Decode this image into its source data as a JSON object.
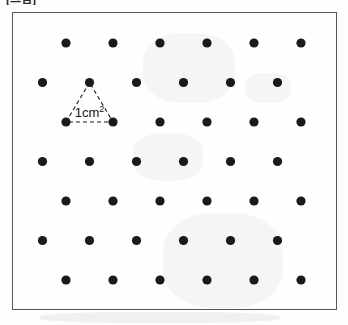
{
  "caption": {
    "fragment_text": "[그림]"
  },
  "figure": {
    "frame": {
      "x": 12,
      "y": 12,
      "width": 325,
      "height": 298,
      "border_color": "#55565a",
      "border_width": 1,
      "fill_color": "#fefefe"
    },
    "dot": {
      "color": "#1a1a1a",
      "radius": 4.6,
      "shape": "circle"
    },
    "lattice": {
      "type": "triangular",
      "columns_per_row": 6,
      "rows": 7,
      "column_spacing": 47,
      "row_spacing": 39.5,
      "row_offset": 23.5,
      "first_row_x": 53,
      "first_row_y": 30,
      "offset_rows": [
        0,
        2,
        4,
        6
      ],
      "points": [
        {
          "row": 0,
          "col": 0,
          "x": 53,
          "y": 30
        },
        {
          "row": 0,
          "col": 1,
          "x": 100,
          "y": 30
        },
        {
          "row": 0,
          "col": 2,
          "x": 147,
          "y": 30
        },
        {
          "row": 0,
          "col": 3,
          "x": 194,
          "y": 30
        },
        {
          "row": 0,
          "col": 4,
          "x": 241,
          "y": 30
        },
        {
          "row": 0,
          "col": 5,
          "x": 288,
          "y": 30
        },
        {
          "row": 1,
          "col": 0,
          "x": 29.5,
          "y": 69.5
        },
        {
          "row": 1,
          "col": 1,
          "x": 76.5,
          "y": 69.5
        },
        {
          "row": 1,
          "col": 2,
          "x": 123.5,
          "y": 69.5
        },
        {
          "row": 1,
          "col": 3,
          "x": 170.5,
          "y": 69.5
        },
        {
          "row": 1,
          "col": 4,
          "x": 217.5,
          "y": 69.5
        },
        {
          "row": 1,
          "col": 5,
          "x": 264.5,
          "y": 69.5
        },
        {
          "row": 2,
          "col": 0,
          "x": 53,
          "y": 109
        },
        {
          "row": 2,
          "col": 1,
          "x": 100,
          "y": 109
        },
        {
          "row": 2,
          "col": 2,
          "x": 147,
          "y": 109
        },
        {
          "row": 2,
          "col": 3,
          "x": 194,
          "y": 109
        },
        {
          "row": 2,
          "col": 4,
          "x": 241,
          "y": 109
        },
        {
          "row": 2,
          "col": 5,
          "x": 288,
          "y": 109
        },
        {
          "row": 3,
          "col": 0,
          "x": 29.5,
          "y": 148.5
        },
        {
          "row": 3,
          "col": 1,
          "x": 76.5,
          "y": 148.5
        },
        {
          "row": 3,
          "col": 2,
          "x": 123.5,
          "y": 148.5
        },
        {
          "row": 3,
          "col": 3,
          "x": 170.5,
          "y": 148.5
        },
        {
          "row": 3,
          "col": 4,
          "x": 217.5,
          "y": 148.5
        },
        {
          "row": 3,
          "col": 5,
          "x": 264.5,
          "y": 148.5
        },
        {
          "row": 4,
          "col": 0,
          "x": 53,
          "y": 188
        },
        {
          "row": 4,
          "col": 1,
          "x": 100,
          "y": 188
        },
        {
          "row": 4,
          "col": 2,
          "x": 147,
          "y": 188
        },
        {
          "row": 4,
          "col": 3,
          "x": 194,
          "y": 188
        },
        {
          "row": 4,
          "col": 4,
          "x": 241,
          "y": 188
        },
        {
          "row": 4,
          "col": 5,
          "x": 288,
          "y": 188
        },
        {
          "row": 5,
          "col": 0,
          "x": 29.5,
          "y": 227.5
        },
        {
          "row": 5,
          "col": 1,
          "x": 76.5,
          "y": 227.5
        },
        {
          "row": 5,
          "col": 2,
          "x": 123.5,
          "y": 227.5
        },
        {
          "row": 5,
          "col": 3,
          "x": 170.5,
          "y": 227.5
        },
        {
          "row": 5,
          "col": 4,
          "x": 217.5,
          "y": 227.5
        },
        {
          "row": 5,
          "col": 5,
          "x": 264.5,
          "y": 227.5
        },
        {
          "row": 6,
          "col": 0,
          "x": 53,
          "y": 267
        },
        {
          "row": 6,
          "col": 1,
          "x": 100,
          "y": 267
        },
        {
          "row": 6,
          "col": 2,
          "x": 147,
          "y": 267
        },
        {
          "row": 6,
          "col": 3,
          "x": 194,
          "y": 267
        },
        {
          "row": 6,
          "col": 4,
          "x": 241,
          "y": 267
        },
        {
          "row": 6,
          "col": 5,
          "x": 288,
          "y": 267
        }
      ]
    },
    "unit_triangle": {
      "label": "1cm",
      "label_superscript": "2",
      "label_x": 76.5,
      "label_y": 104,
      "label_font_size": 13,
      "label_color": "#111111",
      "stroke_color": "#1a1a1a",
      "stroke_width": 1.1,
      "dash_pattern": "4,3",
      "vertices": [
        {
          "name": "apex",
          "x": 76.5,
          "y": 69.5
        },
        {
          "name": "base-left",
          "x": 53,
          "y": 109
        },
        {
          "name": "base-right",
          "x": 100,
          "y": 109
        }
      ]
    }
  }
}
